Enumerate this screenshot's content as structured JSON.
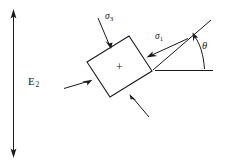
{
  "figure": {
    "background_color": "#ffffff",
    "stroke_color": "#1a1a1a",
    "labels": {
      "vertical_axis": "E",
      "vertical_axis_sub": "2",
      "sigma_major": "σ",
      "sigma_major_sub": "1",
      "sigma_minor": "σ",
      "sigma_minor_sub": "3",
      "angle": "θ",
      "center_marker": "+"
    },
    "elements": {
      "vertical_double_arrow": "double-headed vertical arrow",
      "element_square": "rotated square element",
      "sigma1_arrow": "arrow pointing into right face",
      "sigma1_arrow_opposite": "arrow pointing into left face",
      "sigma3_arrow": "arrow pointing into top face",
      "sigma3_arrow_opposite": "arrow pointing into bottom face",
      "inclined_axis": "inclined principal stress axis line",
      "horizontal_reference": "horizontal reference baseline",
      "angle_arc": "curved arc arrow from baseline to inclined axis"
    }
  }
}
